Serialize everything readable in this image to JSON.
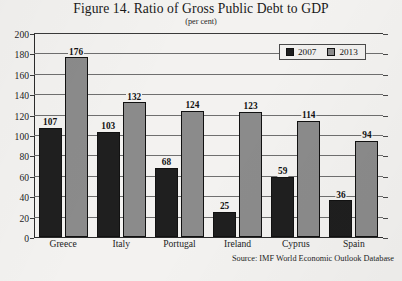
{
  "figure": {
    "title": "Figure 14. Ratio of Gross Public Debt to GDP",
    "subtitle": "(per cent)",
    "source": "Source: IMF World Economic Outlook Database"
  },
  "colors": {
    "series_2007": "#1f1f1f",
    "series_2013": "#8b8b8b",
    "page_background": "#f3f2f0",
    "gridline": "#6f6f6f",
    "axis": "#2b2b2b"
  },
  "chart_data": {
    "type": "bar",
    "title": "Figure 14. Ratio of Gross Public Debt to GDP",
    "subtitle": "(per cent)",
    "xlabel": "",
    "ylabel": "",
    "ylim": [
      0,
      200
    ],
    "yticks": [
      0,
      20,
      40,
      60,
      80,
      100,
      120,
      140,
      160,
      180,
      200
    ],
    "ytick_labels": [
      "0",
      "20",
      "40",
      "60",
      "80",
      "100",
      "120",
      "140",
      "160",
      "180",
      "200"
    ],
    "grid": true,
    "legend_position": "top-right",
    "categories": [
      "Greece",
      "Italy",
      "Portugal",
      "Ireland",
      "Cyprus",
      "Spain"
    ],
    "series": [
      {
        "name": "2007",
        "color": "#1f1f1f",
        "values": [
          107,
          103,
          68,
          25,
          59,
          36
        ],
        "labels": [
          "107",
          "103",
          "68",
          "25",
          "59",
          "36"
        ]
      },
      {
        "name": "2013",
        "color": "#8b8b8b",
        "values": [
          176,
          132,
          124,
          123,
          114,
          94
        ],
        "labels": [
          "176",
          "132",
          "124",
          "123",
          "114",
          "94"
        ]
      }
    ],
    "source": "Source: IMF World Economic Outlook Database"
  },
  "legend": {
    "entries": [
      {
        "label": "2007"
      },
      {
        "label": "2013"
      }
    ]
  }
}
